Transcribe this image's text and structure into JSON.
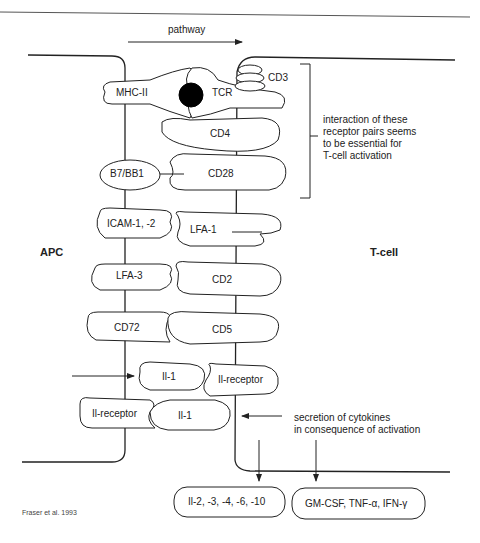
{
  "diagram": {
    "pathway_label": "pathway",
    "cells": {
      "left": "APC",
      "right": "T-cell"
    },
    "receptors": {
      "mhc": "MHC-II",
      "tcr": "TCR",
      "cd3": "CD3",
      "cd4": "CD4",
      "b7": "B7/BB1",
      "cd28": "CD28",
      "icam": "ICAM-1, -2",
      "lfa1": "LFA-1",
      "lfa3": "LFA-3",
      "cd2": "CD2",
      "cd72": "CD72",
      "cd5": "CD5",
      "il1_top": "Il-1",
      "ilr_right": "Il-receptor",
      "ilr_left": "Il-receptor",
      "il1_bottom": "Il-1"
    },
    "annotations": {
      "interaction": [
        "interaction of these",
        "receptor pairs seems",
        "to be essential for",
        "T-cell activation"
      ],
      "secretion": [
        "secretion of cytokines",
        "in consequence of activation"
      ]
    },
    "outputs": {
      "interleukins": "Il-2, -3, -4, -6, -10",
      "other_cytokines": "GM-CSF, TNF-α, IFN-γ"
    },
    "citation": "Fraser et al. 1993",
    "colors": {
      "stroke": "#222222",
      "antigen": "#000000",
      "background": "#ffffff"
    }
  }
}
